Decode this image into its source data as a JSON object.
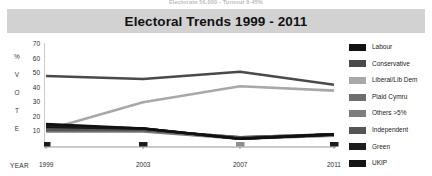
{
  "top_caption": "Electorate 50,000 - Turnout 0-45%",
  "title": "Electoral Trends 1999 - 2011",
  "axis": {
    "y_word_letters": [
      "%",
      "V",
      "O",
      "T",
      "E"
    ],
    "y_ticks": [
      70,
      60,
      50,
      40,
      30,
      20,
      10
    ],
    "x_label": "YEAR",
    "x_ticks": [
      "1999",
      "2003",
      "2007",
      "2011"
    ]
  },
  "legend": [
    {
      "label": "Labour",
      "color": "#111111"
    },
    {
      "label": "Conservative",
      "color": "#4a4a4a"
    },
    {
      "label": "Liberal/Lib Dem",
      "color": "#a8a8a8"
    },
    {
      "label": "Plaid Cymru",
      "color": "#6e6e6e"
    },
    {
      "label": "Others >5%",
      "color": "#7c7c7c"
    },
    {
      "label": "Independent",
      "color": "#555555"
    },
    {
      "label": "Green",
      "color": "#1d1d1d"
    },
    {
      "label": "UKIP",
      "color": "#141414"
    }
  ],
  "chart_data": {
    "type": "line",
    "title": "Electoral Trends 1999 - 2011",
    "xlabel": "YEAR",
    "ylabel": "% VOTE",
    "x": [
      1999,
      2003,
      2007,
      2011
    ],
    "xlim": [
      1999,
      2011
    ],
    "ylim": [
      0,
      70
    ],
    "yticks": [
      10,
      20,
      30,
      40,
      50,
      60,
      70
    ],
    "grid": false,
    "legend_position": "right",
    "series": [
      {
        "name": "Labour",
        "color": "#111111",
        "values": [
          15,
          12,
          5,
          8
        ]
      },
      {
        "name": "Conservative",
        "color": "#4a4a4a",
        "values": [
          48,
          46,
          51,
          42
        ]
      },
      {
        "name": "Liberal/Lib Dem",
        "color": "#a8a8a8",
        "values": [
          11,
          30,
          41,
          38
        ]
      },
      {
        "name": "Plaid Cymru",
        "color": "#6e6e6e",
        "values": [
          12,
          11,
          6,
          8
        ]
      },
      {
        "name": "Others >5%",
        "color": "#7c7c7c",
        "values": [
          10,
          10,
          5,
          7
        ]
      },
      {
        "name": "Independent",
        "color": "#555555",
        "values": [
          11,
          11,
          6,
          8
        ]
      },
      {
        "name": "Green",
        "color": "#1d1d1d",
        "values": [
          14,
          12,
          5,
          8
        ]
      },
      {
        "name": "UKIP",
        "color": "#141414",
        "values": [
          13,
          12,
          5,
          8
        ]
      }
    ]
  }
}
